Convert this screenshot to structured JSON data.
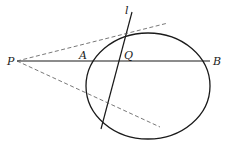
{
  "diagram": {
    "type": "geometry",
    "colors": {
      "stroke": "#1a1a1a",
      "dashed": "#555555",
      "background": "#ffffff"
    },
    "labels": {
      "P": "P",
      "A": "A",
      "Q": "Q",
      "B": "B",
      "l": "l"
    },
    "ellipse": {
      "cx": 148,
      "cy": 86,
      "rx": 62,
      "ry": 53
    },
    "points": {
      "P": [
        17,
        61
      ],
      "A": [
        86,
        61
      ],
      "Q": [
        120,
        61
      ],
      "B": [
        210,
        61
      ]
    },
    "line_l": {
      "from": [
        132,
        12
      ],
      "to": [
        101,
        129
      ]
    },
    "tangent_upper": {
      "from": [
        17,
        61
      ],
      "to": [
        168,
        23
      ]
    },
    "tangent_lower": {
      "from": [
        17,
        61
      ],
      "to": [
        160,
        127
      ]
    }
  }
}
